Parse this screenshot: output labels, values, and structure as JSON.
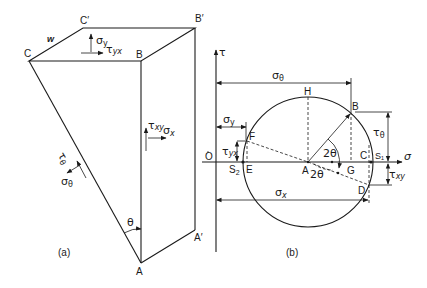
{
  "figure_a": {
    "caption": "(a)",
    "vertices": {
      "C": "C",
      "C_prime": "C′",
      "B": "B",
      "B_prime": "B′",
      "A": "A",
      "A_prime": "A′"
    },
    "edge_label": "w",
    "stresses": {
      "sigma_y": "σy",
      "tau_yx": "τyx",
      "tau_xy": "τxy",
      "sigma_x": "σx",
      "tau_theta": "τθ",
      "sigma_theta": "σθ"
    },
    "angle": "θ"
  },
  "figure_b": {
    "caption": "(b)",
    "axes": {
      "tau": "τ",
      "sigma": "σ",
      "origin": "O"
    },
    "points": {
      "H": "H",
      "B": "B",
      "F": "F",
      "E": "E",
      "A": "A",
      "G": "G",
      "C": "C",
      "D": "D",
      "S1": "S₁",
      "S2": "S₂"
    },
    "dimensions": {
      "sigma_theta": "σθ",
      "sigma_y": "σy",
      "tau_yx": "τyx",
      "tau_theta": "τθ",
      "tau_xy": "τxy",
      "sigma_x": "σx"
    },
    "angles": {
      "upper": "2θ",
      "lower": "2θ"
    }
  }
}
